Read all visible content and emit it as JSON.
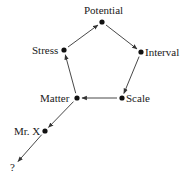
{
  "diagram": {
    "type": "directed-graph",
    "colors": {
      "node": "#111111",
      "edge": "#333333",
      "text": "#1a1a1a",
      "background": "#ffffff"
    },
    "nodes": [
      {
        "id": "potential",
        "label": "Potential",
        "x": 102,
        "y": 22
      },
      {
        "id": "interval",
        "label": "Interval",
        "x": 141,
        "y": 52
      },
      {
        "id": "scale",
        "label": "Scale",
        "x": 122,
        "y": 98
      },
      {
        "id": "matter",
        "label": "Matter",
        "x": 77,
        "y": 98
      },
      {
        "id": "stress",
        "label": "Stress",
        "x": 64,
        "y": 50
      },
      {
        "id": "mrx",
        "label": "Mr. X",
        "x": 45,
        "y": 131
      },
      {
        "id": "unknown",
        "label": "?",
        "x": 14,
        "y": 166
      }
    ],
    "edges": [
      {
        "from": "potential",
        "to": "interval"
      },
      {
        "from": "interval",
        "to": "scale"
      },
      {
        "from": "scale",
        "to": "matter"
      },
      {
        "from": "matter",
        "to": "stress"
      },
      {
        "from": "stress",
        "to": "potential"
      },
      {
        "from": "matter",
        "to": "mrx"
      },
      {
        "from": "mrx",
        "to": "unknown"
      }
    ]
  }
}
